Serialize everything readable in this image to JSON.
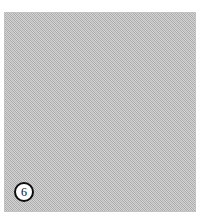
{
  "figure": {
    "panel_label": "6",
    "panel_label_shape": "circle",
    "panel_content": "",
    "colors": {
      "page_background": "#ffffff",
      "panel_fill": "#bdbdbd",
      "panel_border": "#787878",
      "label_ring": "#0d0d0d",
      "label_fill": "#ffffff",
      "label_text": "#0d0d0d"
    },
    "geometry": {
      "panel_left": 4,
      "panel_top": 12,
      "panel_width": 192,
      "panel_height": 200,
      "label_center_x": 24,
      "label_center_y": 192,
      "label_diameter": 20
    },
    "texture": "fine dithered halftone checkerboard"
  }
}
